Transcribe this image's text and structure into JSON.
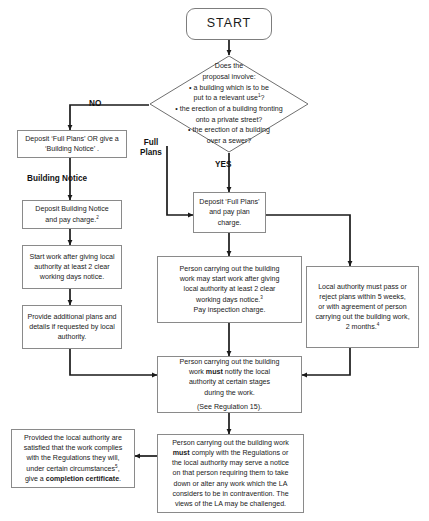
{
  "diagram": {
    "start": {
      "label": "START"
    },
    "decision": {
      "lead1": "Does the",
      "lead2": "proposal involve:",
      "options": [
        "a building which is to be put to a relevant use¹?",
        "the erection of a building fronting onto a private street?",
        "the erection of a building over a sewer?"
      ]
    },
    "labels": {
      "no": "NO",
      "yes": "YES",
      "full_plans": "Full\nPlans",
      "full_plans_line1": "Full",
      "full_plans_line2": "Plans",
      "building_notice": "Building Notice"
    },
    "boxes": {
      "deposit_choice": "Deposit ‘Full Plans’ OR give a ‘Building Notice’ .",
      "deposit_building_notice": "Deposit Building Notice and pay charge.²",
      "start_work_notice": "Start work after giving local authority at least 2 clear working days notice.",
      "provide_additional_plans": "Provide additional plans and details if requested by local authority.",
      "deposit_full_plans": "Deposit ‘Full Plans’ and pay plan charge.",
      "person_may_start_work_l1": "Person carrying out the building work may start work after giving local authority at least 2 clear working days notice.³",
      "person_may_start_work_l2": "Pay inspection charge.",
      "local_authority_pass_reject": "Local authority must pass or reject plans within 5 weeks, or with agreement of person carrying out the building work, 2 months.⁴",
      "notify_stages_l1": "Person carrying out the building work must notify the local authority at certain stages during the work.",
      "notify_stages_l2": "(See Regulation 15).",
      "comply_regulations": "Person carrying out the building work must comply with the Regulations or the local authority may serve a notice on that person requiring them to take down or alter any work which the LA considers to be in contravention. The views of the LA may be challenged.",
      "completion_certificate": "Provided the local authority are satisfied that the work complies with the Regulations they will, under certain circumstances⁵, give a completion certificate."
    },
    "colors": {
      "box_border": "#8a8a8a",
      "line": "#1a1a1a",
      "background": "#ffffff",
      "text": "#1a1a1a"
    }
  }
}
